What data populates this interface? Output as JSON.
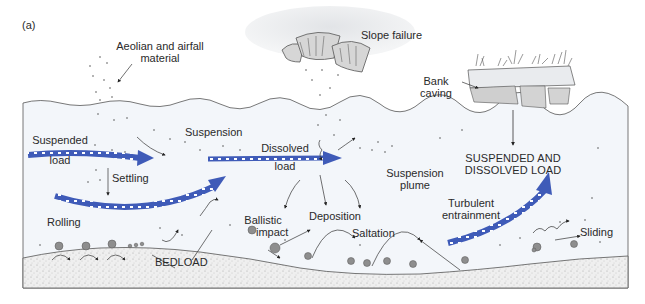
{
  "figure": {
    "panel_label": "(a)"
  },
  "colors": {
    "water": "#f2f5f9",
    "sediment": "#ececec",
    "arrow_blue": "#3f5bb8",
    "arrow_dark": "#2b3a7a",
    "line": "#444444",
    "grain": "#8a8a8a",
    "text": "#2a2a2a"
  },
  "labels": {
    "aeolian": [
      "Aeolian and airfall",
      "material"
    ],
    "slope_failure": "Slope failure",
    "bank_caving": [
      "Bank",
      "caving"
    ],
    "suspended_load": [
      "Suspended",
      "load"
    ],
    "suspension": "Suspension",
    "dissolved_load": [
      "Dissolved",
      "load"
    ],
    "suspension_plume": [
      "Suspension",
      "plume"
    ],
    "suspended_dissolved": [
      "SUSPENDED AND",
      "DISSOLVED LOAD"
    ],
    "settling": "Settling",
    "turbulent_entrainment": [
      "Turbulent",
      "entrainment"
    ],
    "rolling": "Rolling",
    "ballistic_impact": [
      "Ballistic",
      "impact"
    ],
    "deposition": "Deposition",
    "saltation": "Saltation",
    "sliding": "Sliding",
    "bedload": "BEDLOAD"
  }
}
